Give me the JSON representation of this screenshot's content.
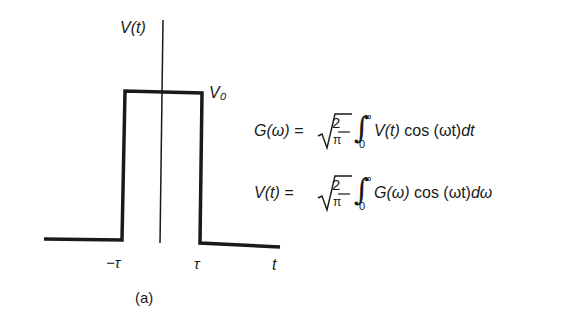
{
  "figure": {
    "caption": "(a)",
    "axis_label_y": "V(t)",
    "axis_label_x": "t",
    "level_label": "V₀",
    "tick_left": "−τ",
    "tick_right": "τ",
    "pulse": {
      "shape": "rectangular",
      "from": "-τ",
      "to": "τ",
      "height": "V₀"
    }
  },
  "equations": [
    {
      "lhs": "G(ω) =",
      "coef_num": "2",
      "coef_den": "π",
      "upper": "∞",
      "lower": "0",
      "integrand_fn": "V(t)",
      "integrand_rest": " cos (ωt)",
      "differential": "dt"
    },
    {
      "lhs": "V(t) =",
      "coef_num": "2",
      "coef_den": "π",
      "upper": "∞",
      "lower": "0",
      "integrand_fn": "G(ω)",
      "integrand_rest": " cos (ωt)",
      "differential": "dω"
    }
  ]
}
